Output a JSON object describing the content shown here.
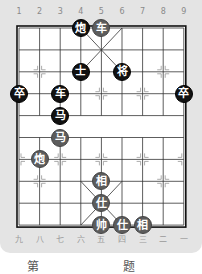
{
  "board": {
    "top_labels": [
      "1",
      "2",
      "3",
      "4",
      "5",
      "6",
      "7",
      "8",
      "9"
    ],
    "bottom_labels": [
      "九",
      "八",
      "七",
      "六",
      "五",
      "四",
      "三",
      "二",
      "一"
    ],
    "river_text": "",
    "colors": {
      "panel": "#e4e4e4",
      "board": "#ffffff",
      "lines": "#222222",
      "black_piece": "#111111",
      "red_piece": "#5c5c5c"
    }
  },
  "pieces": [
    {
      "char": "炮",
      "side": "black",
      "col": 4,
      "row": 0
    },
    {
      "char": "车",
      "side": "red",
      "col": 5,
      "row": 0
    },
    {
      "char": "士",
      "side": "black",
      "col": 4,
      "row": 2
    },
    {
      "char": "将",
      "side": "black",
      "col": 6,
      "row": 2
    },
    {
      "char": "卒",
      "side": "black",
      "col": 1,
      "row": 3
    },
    {
      "char": "车",
      "side": "black",
      "col": 3,
      "row": 3
    },
    {
      "char": "卒",
      "side": "black",
      "col": 9,
      "row": 3
    },
    {
      "char": "马",
      "side": "black",
      "col": 3,
      "row": 4
    },
    {
      "char": "马",
      "side": "red",
      "col": 3,
      "row": 5
    },
    {
      "char": "炮",
      "side": "red",
      "col": 2,
      "row": 6
    },
    {
      "char": "相",
      "side": "red",
      "col": 5,
      "row": 7
    },
    {
      "char": "仕",
      "side": "red",
      "col": 5,
      "row": 8
    },
    {
      "char": "帅",
      "side": "red",
      "col": 5,
      "row": 9
    },
    {
      "char": "仕",
      "side": "red",
      "col": 6,
      "row": 9
    },
    {
      "char": "相",
      "side": "red",
      "col": 7,
      "row": 9
    }
  ],
  "caption": "第 题"
}
